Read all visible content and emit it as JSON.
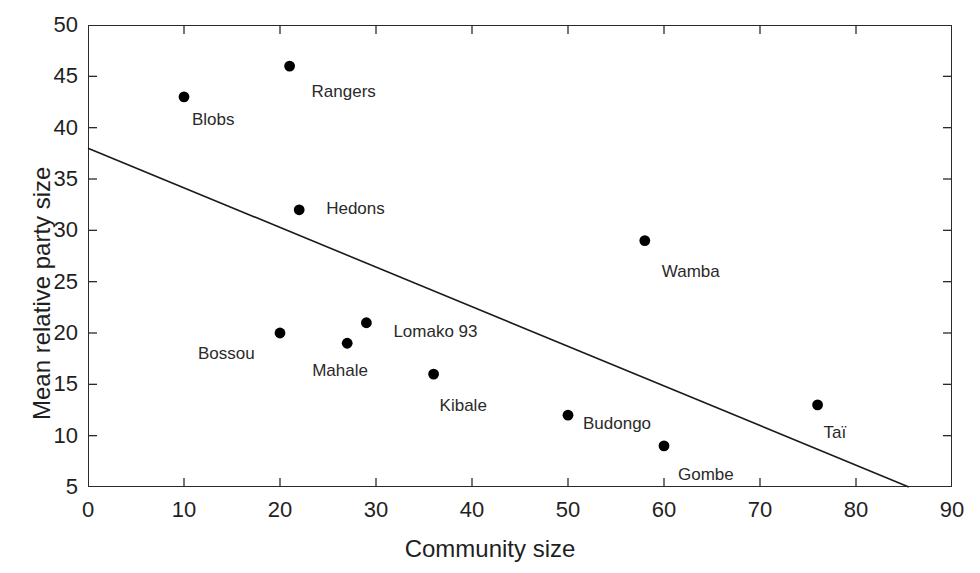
{
  "chart_data": {
    "type": "scatter",
    "title": "",
    "xlabel": "Community size",
    "ylabel": "Mean relative party size",
    "xlim": [
      0,
      90
    ],
    "ylim": [
      5,
      50
    ],
    "xticks": [
      0,
      10,
      20,
      30,
      40,
      50,
      60,
      70,
      80,
      90
    ],
    "yticks": [
      5,
      10,
      15,
      20,
      25,
      30,
      35,
      40,
      45,
      50
    ],
    "grid": false,
    "legend": "none",
    "marker": "filled-circle",
    "marker_color": "#000000",
    "axis_color": "#2b2b2b",
    "background": "#ffffff",
    "points": [
      {
        "label": "Blobs",
        "x": 10,
        "y": 43
      },
      {
        "label": "Rangers",
        "x": 21,
        "y": 46
      },
      {
        "label": "Hedons",
        "x": 22,
        "y": 32
      },
      {
        "label": "Wamba",
        "x": 58,
        "y": 29
      },
      {
        "label": "Lomako 93",
        "x": 29,
        "y": 21
      },
      {
        "label": "Bossou",
        "x": 20,
        "y": 20
      },
      {
        "label": "Mahale",
        "x": 27,
        "y": 19
      },
      {
        "label": "Kibale",
        "x": 36,
        "y": 16
      },
      {
        "label": "Taï",
        "x": 76,
        "y": 13
      },
      {
        "label": "Budongo",
        "x": 50,
        "y": 12
      },
      {
        "label": "Gombe",
        "x": 60,
        "y": 9
      }
    ],
    "trendline": {
      "type": "linear-fit",
      "x_start": 0,
      "y_start": 38,
      "x_end": 85.5,
      "y_end": 5,
      "color": "#1a1a1a"
    },
    "label_offsets": [
      {
        "label": "Blobs",
        "dx": 8,
        "dy": 22
      },
      {
        "label": "Rangers",
        "dx": 22,
        "dy": 25
      },
      {
        "label": "Hedons",
        "dx": 27,
        "dy": -2
      },
      {
        "label": "Wamba",
        "dx": 17,
        "dy": 30
      },
      {
        "label": "Lomako 93",
        "dx": 27,
        "dy": 8
      },
      {
        "label": "Bossou",
        "dx": -82,
        "dy": 20
      },
      {
        "label": "Mahale",
        "dx": -35,
        "dy": 27
      },
      {
        "label": "Kibale",
        "dx": 6,
        "dy": 31
      },
      {
        "label": "Taï",
        "dx": 6,
        "dy": 27
      },
      {
        "label": "Budongo",
        "dx": 15,
        "dy": 8
      },
      {
        "label": "Gombe",
        "dx": 14,
        "dy": 28
      }
    ]
  }
}
